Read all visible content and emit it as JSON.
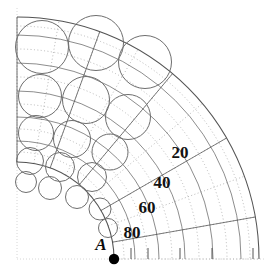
{
  "figure": {
    "type": "polar-circle-packing-diagram",
    "background_color": "#ffffff",
    "width": 268,
    "height": 275,
    "point_label": "A",
    "point_marker": {
      "name": "point-a-dot",
      "cx": 114,
      "cy": 259,
      "r": 5.2,
      "color": "#000000"
    },
    "angular_labels": [
      {
        "text": "20",
        "x": 180,
        "y": 152
      },
      {
        "text": "40",
        "x": 162,
        "y": 182
      },
      {
        "text": "60",
        "x": 147,
        "y": 207
      },
      {
        "text": "80",
        "x": 132,
        "y": 232
      }
    ],
    "point_label_pos": {
      "x": 101,
      "y": 244
    },
    "colors": {
      "arc_solid": "#4a4a4a",
      "arc_dotted": "#b9b9b9",
      "circle_stroke": "#6e6e6e",
      "frame_dotted": "#d6d6d6",
      "tick": "#555555",
      "marker": "#000000",
      "text": "#111111"
    },
    "geometry": {
      "center_x": 17,
      "center_y": 259,
      "inner_radius": 97,
      "outer_radius": 242,
      "angle_start_deg": 0,
      "angle_end_deg": 90,
      "radial_ring_radii": [
        97,
        118,
        142,
        168,
        196,
        224,
        242
      ],
      "angular_division_deg": [
        0,
        10,
        20,
        30,
        40,
        50,
        60,
        70,
        80,
        90
      ]
    },
    "frame": {
      "left_x": 17,
      "bottom_y": 259,
      "top_y": 8,
      "right_x": 266
    },
    "ticks": [
      {
        "x": 131,
        "y": 259,
        "len": 11
      },
      {
        "x": 148,
        "y": 259,
        "len": 11
      },
      {
        "x": 180,
        "y": 259,
        "len": 11
      },
      {
        "x": 212,
        "y": 259,
        "len": 11
      },
      {
        "x": 253,
        "y": 259,
        "len": 11
      }
    ],
    "circles": [
      {
        "cx": 42,
        "cy": 47,
        "r": 26.5
      },
      {
        "cx": 96,
        "cy": 43,
        "r": 27.5
      },
      {
        "cx": 145,
        "cy": 62,
        "r": 26.5
      },
      {
        "cx": 40,
        "cy": 96,
        "r": 21.5
      },
      {
        "cx": 86,
        "cy": 100,
        "r": 23.5
      },
      {
        "cx": 128,
        "cy": 117,
        "r": 22.5
      },
      {
        "cx": 36,
        "cy": 133,
        "r": 17.5
      },
      {
        "cx": 72,
        "cy": 139,
        "r": 18.5
      },
      {
        "cx": 110,
        "cy": 152,
        "r": 18.0
      },
      {
        "cx": 30,
        "cy": 161,
        "r": 13.5
      },
      {
        "cx": 60,
        "cy": 167,
        "r": 14.5
      },
      {
        "cx": 92,
        "cy": 177,
        "r": 14.5
      },
      {
        "cx": 26,
        "cy": 182,
        "r": 10.5
      },
      {
        "cx": 50,
        "cy": 188,
        "r": 11.5
      },
      {
        "cx": 77,
        "cy": 197,
        "r": 11.5
      },
      {
        "cx": 100,
        "cy": 209,
        "r": 11.0
      },
      {
        "cx": 108,
        "cy": 228,
        "r": 9.5
      }
    ]
  }
}
